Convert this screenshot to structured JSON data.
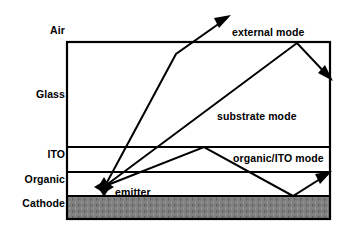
{
  "figure": {
    "background_color": "#ffffff",
    "line_color": "#000000",
    "cathode_fill_color": "#808080",
    "stack_box": {
      "x": 67,
      "y": 42,
      "width": 263,
      "height": 177
    }
  },
  "layers": [
    {
      "name": "air",
      "label": "Air",
      "label_x": 38,
      "label_y": 30,
      "fill": "none"
    },
    {
      "name": "glass",
      "label": "Glass",
      "label_x": 28,
      "label_y": 94,
      "fill": "none",
      "top_y": 42,
      "bottom_y": 147
    },
    {
      "name": "ito",
      "label": "ITO",
      "label_x": 36,
      "label_y": 154,
      "fill": "none",
      "top_y": 147,
      "bottom_y": 172
    },
    {
      "name": "organic",
      "label": "Organic",
      "label_x": 14,
      "label_y": 179,
      "fill": "none",
      "top_y": 172,
      "bottom_y": 196
    },
    {
      "name": "cathode",
      "label": "Cathode",
      "label_x": 13,
      "label_y": 203,
      "fill": "#808080",
      "top_y": 196,
      "bottom_y": 219
    }
  ],
  "mode_labels": [
    {
      "name": "external-mode",
      "text": "external mode",
      "x": 232,
      "y": 26
    },
    {
      "name": "substrate-mode",
      "text": "substrate mode",
      "x": 217,
      "y": 110
    },
    {
      "name": "organic-ito-mode",
      "text": "organic/ITO mode",
      "x": 233,
      "y": 152
    },
    {
      "name": "emitter",
      "text": "emitter",
      "x": 115,
      "y": 186
    }
  ],
  "emitter": {
    "name": "emitter-cross-arrow",
    "x": 104,
    "y": 187,
    "arm": 9
  },
  "rays": [
    {
      "name": "external-mode-ray",
      "points": "105,186 176,54 227,18",
      "arrow_at": {
        "x": 227,
        "y": 18,
        "angle_deg": -35
      }
    },
    {
      "name": "substrate-mode-ray",
      "points": "105,186 297,43 329,77",
      "arrow_at": {
        "x": 329,
        "y": 77,
        "angle_deg": 47
      }
    },
    {
      "name": "organic-ito-mode-ray",
      "points": "105,186 204,147 293,196 328,174",
      "arrow_at": {
        "x": 328,
        "y": 174,
        "angle_deg": -32
      }
    }
  ]
}
